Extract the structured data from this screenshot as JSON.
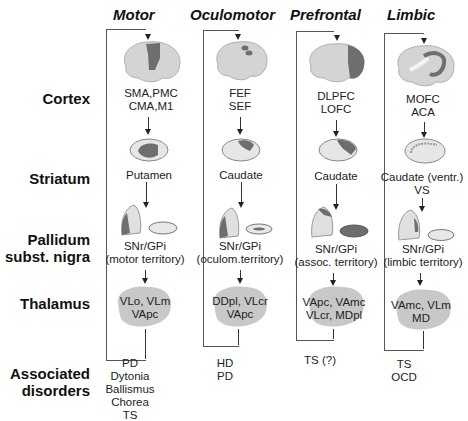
{
  "row_labels": {
    "cortex": "Cortex",
    "striatum": "Striatum",
    "pallidum_line1": "Pallidum",
    "pallidum_line2": "subst. nigra",
    "thalamus": "Thalamus",
    "disorders_line1": "Associated",
    "disorders_line2": "disorders"
  },
  "columns": [
    {
      "title": "Motor",
      "cortex": [
        "SMA,PMC",
        "CMA,M1"
      ],
      "striatum": [
        "Putamen"
      ],
      "pallidum": [
        "SNr/GPi",
        "(motor territory)"
      ],
      "thalamus": [
        "VLo, VLm",
        "VApc"
      ],
      "disorders": [
        "PD",
        "Dytonia",
        "Ballismus",
        "Chorea",
        "TS"
      ]
    },
    {
      "title": "Oculomotor",
      "cortex": [
        "FEF",
        "SEF"
      ],
      "striatum": [
        "Caudate"
      ],
      "pallidum": [
        "SNr/GPi",
        "(oculom.territory)"
      ],
      "thalamus": [
        "DDpl, VLcr",
        "VApc"
      ],
      "disorders": [
        "HD",
        "PD"
      ]
    },
    {
      "title": "Prefrontal",
      "cortex": [
        "DLPFC",
        "LOFC"
      ],
      "striatum": [
        "Caudate"
      ],
      "pallidum": [
        "SNr/GPi",
        "(assoc. territory)"
      ],
      "thalamus": [
        "VApc, VAmc",
        "VLcr, MDpl"
      ],
      "disorders": [
        "TS (?)"
      ]
    },
    {
      "title": "Limbic",
      "cortex": [
        "MOFC",
        "ACA"
      ],
      "striatum": [
        "Caudate (ventr.)",
        "VS"
      ],
      "pallidum": [
        "SNr/GPi",
        "(limbic territory)"
      ],
      "thalamus": [
        "VAmc, VLm",
        "MD"
      ],
      "disorders": [
        "TS",
        "OCD"
      ]
    }
  ],
  "colors": {
    "brain_fill": "#d4d4d4",
    "highlight": "#6e6e6e",
    "thalamus_fill": "#c8c8c8",
    "line": "#444444"
  }
}
